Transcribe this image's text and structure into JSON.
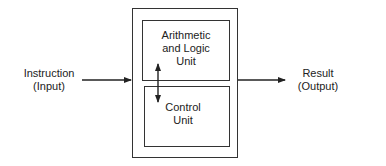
{
  "diagram": {
    "input": {
      "line1": "Instruction",
      "line2": "(Input)"
    },
    "output": {
      "line1": "Result",
      "line2": "(Output)"
    },
    "alu": {
      "line1": "Arithmetic",
      "line2": "and Logic",
      "line3": "Unit"
    },
    "control": {
      "line1": "Control",
      "line2": "Unit"
    }
  }
}
